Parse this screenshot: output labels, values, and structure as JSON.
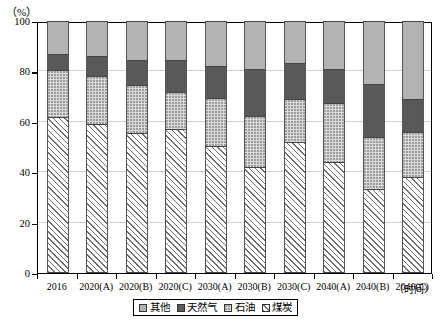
{
  "chart_data": {
    "type": "bar",
    "stacked": true,
    "title": "",
    "xlabel": "（时间）",
    "ylabel": "（%）",
    "ylim": [
      0,
      100
    ],
    "yticks": [
      0,
      20,
      40,
      60,
      80,
      100
    ],
    "ytick_labels": [
      "0",
      "20",
      "40",
      "60",
      "80",
      "100"
    ],
    "grid": true,
    "legend_position": "bottom",
    "categories": [
      "2016",
      "2020(A)",
      "2020(B)",
      "2020(C)",
      "2030(A)",
      "2030(B)",
      "2030(C)",
      "2040(A)",
      "2040(B)",
      "2040(C)"
    ],
    "series": [
      {
        "name": "煤炭",
        "key": "coal",
        "color": "#ffffff",
        "pattern": "diagonal-hatch",
        "values": [
          62,
          59,
          55.5,
          57,
          50.5,
          42,
          52,
          44,
          33.5,
          38
        ]
      },
      {
        "name": "石油",
        "key": "oil",
        "color": "#d9d9d9",
        "pattern": "dotted",
        "values": [
          18.5,
          19,
          19,
          15,
          19,
          20.5,
          17,
          23.5,
          20.5,
          18
        ]
      },
      {
        "name": "天然气",
        "key": "gas",
        "color": "#595959",
        "pattern": "solid",
        "values": [
          6.5,
          8,
          10,
          12.5,
          12.5,
          18.5,
          14.5,
          13.5,
          21,
          13
        ]
      },
      {
        "name": "其他",
        "key": "other",
        "color": "#b3b3b3",
        "pattern": "solid",
        "values": [
          13,
          14,
          15.5,
          15.5,
          18,
          19,
          16.5,
          19,
          25,
          31
        ]
      }
    ],
    "legend_entries": [
      {
        "label": "其他",
        "color": "#b3b3b3",
        "pattern": "solid"
      },
      {
        "label": "天然气",
        "color": "#595959",
        "pattern": "solid"
      },
      {
        "label": "石油",
        "color": "#d9d9d9",
        "pattern": "dotted"
      },
      {
        "label": "煤炭",
        "color": "#ffffff",
        "pattern": "diagonal-hatch"
      }
    ]
  }
}
